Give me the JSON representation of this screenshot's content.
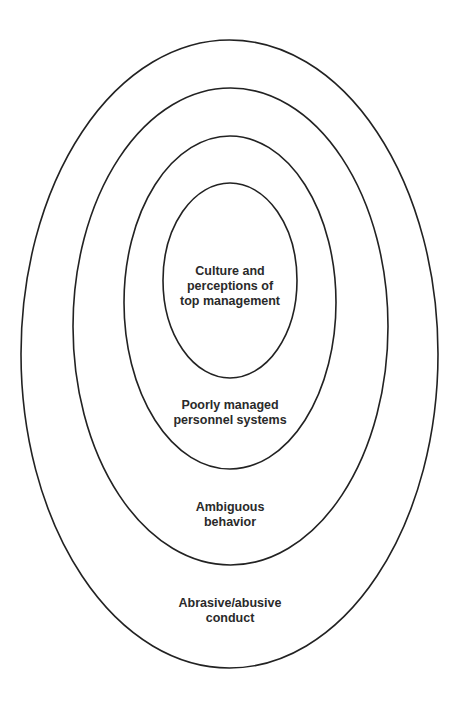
{
  "diagram": {
    "type": "concentric-ellipses",
    "stroke_color": "#222222",
    "background": "#ffffff",
    "layers": [
      {
        "id": "abrasive",
        "level": 1,
        "lines": [
          "Abrasive/abusive",
          "conduct"
        ],
        "ellipse": {
          "cx": 229.5,
          "cy": 354,
          "rx": 208.5,
          "ry": 314
        }
      },
      {
        "id": "ambiguous",
        "level": 2,
        "lines": [
          "Ambiguous",
          "behavior"
        ],
        "ellipse": {
          "cx": 230.5,
          "cy": 326.5,
          "rx": 157.5,
          "ry": 238.5
        }
      },
      {
        "id": "personnel",
        "level": 3,
        "lines": [
          "Poorly managed",
          "personnel systems"
        ],
        "ellipse": {
          "cx": 230,
          "cy": 302.5,
          "rx": 106,
          "ry": 166.5
        }
      },
      {
        "id": "culture",
        "level": 4,
        "lines": [
          "Culture and",
          "perceptions of",
          "top management"
        ],
        "ellipse": {
          "cx": 230,
          "cy": 280.5,
          "rx": 67,
          "ry": 97.5
        }
      }
    ]
  }
}
